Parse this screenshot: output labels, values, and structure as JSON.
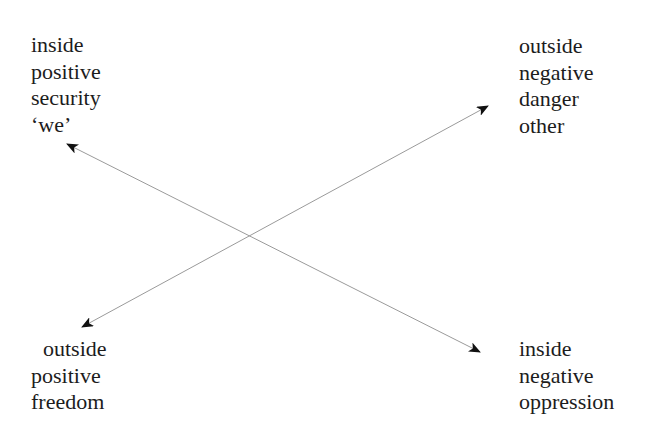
{
  "diagram": {
    "type": "crossed-arrows-quadrant",
    "colors": {
      "text": "#1c1c1c",
      "line": "#9a9a9a",
      "arrowhead": "#111111",
      "background": "#ffffff"
    },
    "corners": {
      "top_left": {
        "lines": [
          "inside",
          "positive",
          "security",
          "‘we’"
        ]
      },
      "top_right": {
        "lines": [
          "outside",
          "negative",
          "danger",
          "other"
        ]
      },
      "bottom_left": {
        "lines": [
          "outside",
          "positive",
          "freedom"
        ]
      },
      "bottom_right": {
        "lines": [
          "inside",
          "negative",
          "oppression"
        ]
      }
    },
    "arrows": [
      {
        "name": "inside-axis",
        "from": "top_left",
        "to": "bottom_right",
        "start": [
          67,
          144
        ],
        "end": [
          480,
          352
        ],
        "double_headed": true
      },
      {
        "name": "outside-axis",
        "from": "bottom_left",
        "to": "top_right",
        "start": [
          82,
          327
        ],
        "end": [
          488,
          106
        ],
        "double_headed": true
      }
    ],
    "crossing_point": [
      249,
      236
    ]
  }
}
